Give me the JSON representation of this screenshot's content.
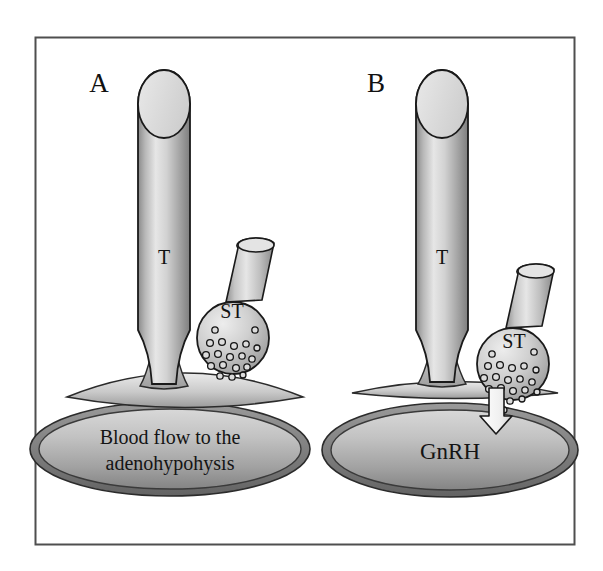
{
  "figure": {
    "domain_type": "diagram",
    "title_text": null,
    "background_color": "#ffffff",
    "border_color": "#555555",
    "ink_color": "#111111",
    "frame": {
      "x": 35,
      "y": 37,
      "width": 540,
      "height": 508
    }
  },
  "panels": [
    {
      "id": "panel-a",
      "letter": "A",
      "letter_pos": {
        "x": 99,
        "y": 92
      },
      "tuberal_label": "T",
      "tuberal_label_pos": {
        "x": 164,
        "y": 264
      },
      "saccus_label": "ST",
      "saccus_label_pos": {
        "x": 232,
        "y": 318
      },
      "ellipse_label_lines": [
        "Blood flow to the",
        "adenohypohysis"
      ],
      "has_release_arrow": false,
      "cylinder": {
        "cx": 164,
        "top_y": 70,
        "bottom_y": 378,
        "radius_x": 26,
        "cap_radius_y": 34,
        "waist_radius_x": 12
      },
      "saccus": {
        "bulb_cx": 233,
        "bulb_cy": 338,
        "bulb_r": 36,
        "neck_top_cx": 250,
        "neck_top_cy": 242,
        "neck_rx": 18,
        "neck_ry": 7
      },
      "lens": {
        "cx": 185,
        "cy": 392,
        "rx": 118,
        "ry": 22
      },
      "ellipse": {
        "cx": 170,
        "cy": 449,
        "rx": 140,
        "ry": 47
      }
    },
    {
      "id": "panel-b",
      "letter": "B",
      "letter_pos": {
        "x": 376,
        "y": 92
      },
      "tuberal_label": "T",
      "tuberal_label_pos": {
        "x": 442,
        "y": 264
      },
      "saccus_label": "ST",
      "saccus_label_pos": {
        "x": 514,
        "y": 348
      },
      "ellipse_label_lines": [
        "GnRH"
      ],
      "has_release_arrow": true,
      "cylinder": {
        "cx": 442,
        "top_y": 70,
        "bottom_y": 378,
        "radius_x": 26,
        "cap_radius_y": 34,
        "waist_radius_x": 12
      },
      "saccus": {
        "bulb_cx": 513,
        "bulb_cy": 364,
        "bulb_r": 36,
        "neck_top_cx": 533,
        "neck_top_cy": 268,
        "neck_rx": 18,
        "neck_ry": 7
      },
      "lens": {
        "cx": 455,
        "cy": 392,
        "rx": 105,
        "ry": 13
      },
      "ellipse": {
        "cx": 450,
        "cy": 450,
        "rx": 128,
        "ry": 47
      },
      "arrow": {
        "x": 496,
        "y_top": 390,
        "y_tip": 431,
        "shaft_w": 15,
        "head_w": 28
      }
    }
  ],
  "granules": {
    "fill_color": "#d9d9d9",
    "stroke_color": "#1a1a1a",
    "panel_a_count": 19,
    "panel_b_count": 21,
    "panel_a_points": [
      [
        215,
        330,
        3.2
      ],
      [
        255,
        330,
        3.2
      ],
      [
        210,
        343,
        3.4
      ],
      [
        222,
        342,
        3.4
      ],
      [
        234,
        346,
        3.4
      ],
      [
        246,
        344,
        3.2
      ],
      [
        257,
        348,
        3.0
      ],
      [
        206,
        355,
        3.4
      ],
      [
        218,
        354,
        3.4
      ],
      [
        230,
        357,
        3.4
      ],
      [
        242,
        356,
        3.2
      ],
      [
        252,
        359,
        3.2
      ],
      [
        211,
        366,
        3.4
      ],
      [
        223,
        365,
        3.4
      ],
      [
        236,
        368,
        3.4
      ],
      [
        247,
        367,
        3.2
      ],
      [
        220,
        376,
        3.2
      ],
      [
        232,
        377,
        3.2
      ],
      [
        243,
        375,
        3.0
      ]
    ],
    "panel_b_points": [
      [
        492,
        354,
        3.2
      ],
      [
        534,
        352,
        3.2
      ],
      [
        488,
        366,
        3.4
      ],
      [
        500,
        365,
        3.4
      ],
      [
        512,
        368,
        3.4
      ],
      [
        524,
        366,
        3.2
      ],
      [
        536,
        370,
        3.0
      ],
      [
        484,
        378,
        3.4
      ],
      [
        496,
        377,
        3.4
      ],
      [
        508,
        380,
        3.4
      ],
      [
        520,
        379,
        3.2
      ],
      [
        532,
        382,
        3.2
      ],
      [
        489,
        389,
        3.4
      ],
      [
        501,
        388,
        3.4
      ],
      [
        513,
        391,
        3.4
      ],
      [
        525,
        390,
        3.2
      ],
      [
        537,
        392,
        3.0
      ],
      [
        498,
        400,
        3.2
      ],
      [
        510,
        401,
        3.2
      ],
      [
        522,
        399,
        3.0
      ],
      [
        504,
        410,
        3.0
      ]
    ]
  },
  "palette": {
    "cylinder_light": "#e8e8e8",
    "cylinder_mid": "#c9c9c9",
    "cylinder_dark": "#8f8f8f",
    "cap_fill": "#dedede",
    "ellipse_light": "#cfcfcf",
    "ellipse_dark": "#8a8a8a",
    "ellipse_ring": "#6e6e6e",
    "lens_light": "#e0e0e0",
    "lens_dark": "#a0a0a0",
    "arrow_fill": "#f2f2f2",
    "outline": "#1a1a1a"
  }
}
